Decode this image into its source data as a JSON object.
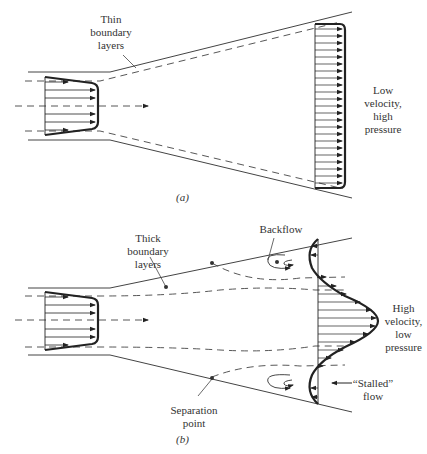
{
  "figure_a": {
    "label_thin": [
      "Thin",
      "boundary",
      "layers"
    ],
    "label_right": [
      "Low",
      "velocity,",
      "high",
      "pressure"
    ],
    "caption": "(a)"
  },
  "figure_b": {
    "label_thick": [
      "Thick",
      "boundary",
      "layers"
    ],
    "label_backflow": "Backflow",
    "label_right": [
      "High",
      "velocity,",
      "low",
      "pressure"
    ],
    "label_stalled": [
      "“Stalled”",
      "flow"
    ],
    "label_separation": [
      "Separation",
      "point"
    ],
    "caption": "(b)"
  }
}
